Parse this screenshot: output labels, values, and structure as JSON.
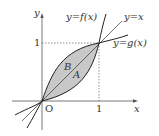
{
  "diagram": {
    "axes": {
      "x_label": "x",
      "y_label": "y",
      "origin_label": "O",
      "x_tick": "1",
      "y_tick": "1"
    },
    "curves": {
      "f_label": "y=f(x)",
      "line_label": "y=x",
      "g_label": "y=g(x)"
    },
    "regions": {
      "A": "A",
      "B": "B"
    },
    "colors": {
      "fill": "#c8c8c8",
      "curve": "#222222",
      "axis": "#555555",
      "dashed": "#666666"
    }
  }
}
